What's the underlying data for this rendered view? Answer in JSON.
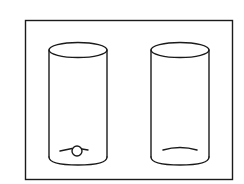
{
  "diagram": {
    "frame": {
      "stroke": "#1a1a1a",
      "background": "#ffffff"
    },
    "containers": [
      {
        "id": "left-cylinder",
        "contents": "small-sphere-with-rod"
      },
      {
        "id": "right-cylinder",
        "contents": "curved-line-at-bottom"
      }
    ]
  }
}
